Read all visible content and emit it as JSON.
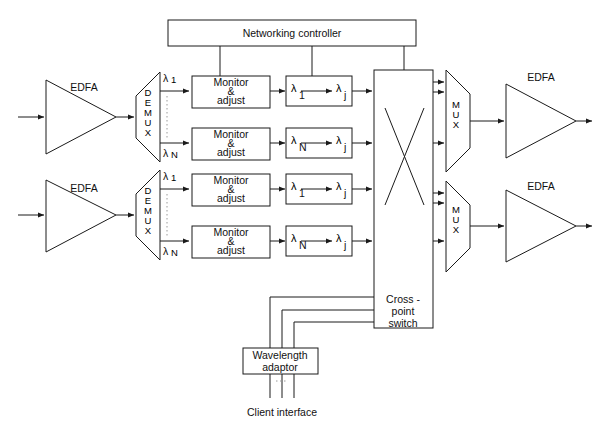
{
  "figure": {
    "caption": ""
  },
  "controller": {
    "label": "Networking controller"
  },
  "edfa": {
    "label": "EDFA"
  },
  "demux": {
    "label": "DEMUX",
    "letters": [
      "D",
      "E",
      "M",
      "U",
      "X"
    ]
  },
  "mux": {
    "label": "MUX",
    "letters": [
      "M",
      "U",
      "X"
    ]
  },
  "monitor": {
    "line1": "Monitor",
    "line2": "&",
    "line3": "adjust"
  },
  "converter": {
    "from_first": "λ",
    "from_first_sub": "1",
    "from_last": "λ",
    "from_last_sub": "N",
    "to": "λ",
    "to_sub": "j"
  },
  "wavelengths": {
    "first": "λ",
    "first_sub": "1",
    "last": "λ",
    "last_sub": "N"
  },
  "crosspoint": {
    "line1": "Cross -",
    "line2": "point",
    "line3": "switch"
  },
  "adaptor": {
    "line1": "Wavelength",
    "line2": "adaptor"
  },
  "client": {
    "label": "Client interface"
  },
  "colors": {
    "stroke": "#1a1a1a",
    "text": "#111111",
    "background": "#ffffff",
    "dotted": "#9a9a9a"
  },
  "rows": [
    {
      "id": "row-1",
      "channels": [
        "λ1",
        "λN"
      ]
    },
    {
      "id": "row-2",
      "channels": [
        "λ1",
        "λN"
      ]
    }
  ]
}
